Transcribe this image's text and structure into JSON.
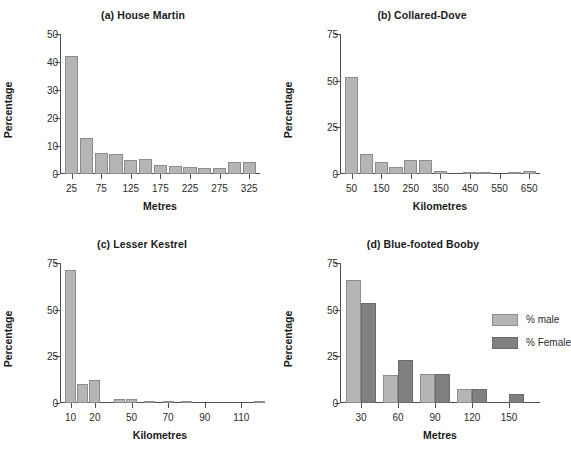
{
  "figure": {
    "panels": [
      {
        "id": "a",
        "title": "(a) House Martin",
        "xlabel": "Metres",
        "ylabel": "Percentage"
      },
      {
        "id": "b",
        "title": "(b) Collared-Dove",
        "xlabel": "Kilometres",
        "ylabel": "Percentage"
      },
      {
        "id": "c",
        "title": "(c) Lesser Kestrel",
        "xlabel": "Kilometres",
        "ylabel": "Percentage"
      },
      {
        "id": "d",
        "title": "(d) Blue-footed Booby",
        "xlabel": "Metres",
        "ylabel": "Percentage",
        "legend": [
          {
            "label": "% male",
            "color": "#b5b5b5"
          },
          {
            "label": "% Female",
            "color": "#808080"
          }
        ]
      }
    ]
  },
  "chart_data": [
    {
      "type": "bar",
      "title": "(a) House Martin",
      "xlabel": "Metres",
      "ylabel": "Percentage",
      "ylim": [
        0,
        50
      ],
      "yticks": [
        0,
        10,
        20,
        30,
        40,
        50
      ],
      "xticks": [
        25,
        75,
        125,
        175,
        225,
        275,
        325
      ],
      "grid": false,
      "legend": null,
      "categories": [
        25,
        50,
        75,
        100,
        125,
        150,
        175,
        200,
        225,
        250,
        275,
        300,
        325
      ],
      "values": [
        42,
        12.8,
        7.4,
        7.1,
        4.9,
        5.2,
        3.2,
        2.7,
        2.4,
        2.2,
        2.0,
        4.2,
        4.2
      ],
      "bar_color": "#b5b5b5"
    },
    {
      "type": "bar",
      "title": "(b) Collared-Dove",
      "xlabel": "Kilometres",
      "ylabel": "Percentage",
      "ylim": [
        0,
        75
      ],
      "yticks": [
        0,
        25,
        50,
        75
      ],
      "xticks": [
        50,
        150,
        250,
        350,
        450,
        550,
        650
      ],
      "grid": false,
      "legend": null,
      "categories": [
        50,
        100,
        150,
        200,
        250,
        300,
        350,
        400,
        450,
        500,
        550,
        600,
        650
      ],
      "values": [
        52,
        10.5,
        6.2,
        4.0,
        7.6,
        7.4,
        1.5,
        0,
        1.2,
        1.3,
        0,
        1.3,
        1.8
      ],
      "bar_color": "#b5b5b5"
    },
    {
      "type": "bar",
      "title": "(c) Lesser Kestrel",
      "xlabel": "Kilometres",
      "ylabel": "Percentage",
      "ylim": [
        0,
        75
      ],
      "yticks": [
        0,
        25,
        50,
        75
      ],
      "xticks": [
        10,
        20,
        50,
        70,
        90,
        110
      ],
      "grid": false,
      "legend": null,
      "categories": [
        10,
        15,
        20,
        30,
        50,
        60,
        70,
        80,
        90,
        110,
        120
      ],
      "values": [
        71,
        10.2,
        12.1,
        2.0,
        2.0,
        1.2,
        1.2,
        0.9,
        0,
        0,
        0.6
      ],
      "bar_color": "#b5b5b5"
    },
    {
      "type": "bar",
      "title": "(d) Blue-footed Booby",
      "xlabel": "Metres",
      "ylabel": "Percentage",
      "ylim": [
        0,
        75
      ],
      "yticks": [
        0,
        25,
        50,
        75
      ],
      "xticks": [
        30,
        60,
        90,
        120,
        150
      ],
      "grid": false,
      "legend": {
        "position": "upper-right",
        "entries": [
          "% male",
          "% Female"
        ]
      },
      "categories": [
        30,
        60,
        90,
        120,
        150
      ],
      "series": [
        {
          "name": "% male",
          "color": "#b5b5b5",
          "values": [
            66,
            15.2,
            15.4,
            7.6,
            0
          ]
        },
        {
          "name": "% Female",
          "color": "#808080",
          "values": [
            53.5,
            23,
            15.6,
            7.7,
            4.7
          ]
        }
      ]
    }
  ]
}
